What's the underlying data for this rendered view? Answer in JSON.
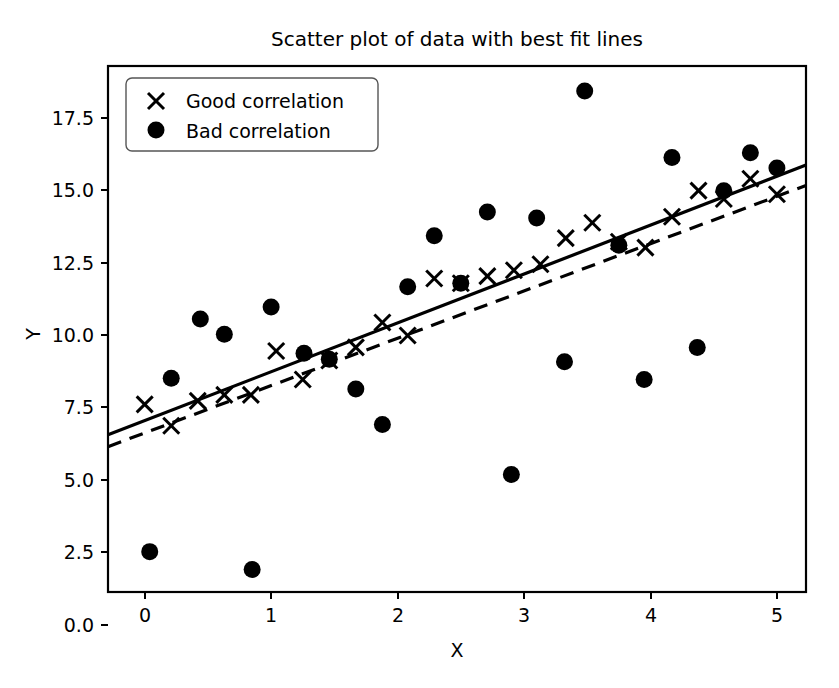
{
  "chart_data": {
    "type": "scatter",
    "title": "Scatter plot of data with best fit lines",
    "xlabel": "X",
    "ylabel": "Y",
    "xlim": [
      -0.29,
      5.23
    ],
    "ylim": [
      -2.2,
      19.95
    ],
    "grid": false,
    "legend_position": "upper left",
    "xticks": [
      "0",
      "1",
      "2",
      "3",
      "4",
      "5"
    ],
    "xtick_values": [
      0,
      1,
      2,
      3,
      4,
      5
    ],
    "yticks": [
      "0.0",
      "2.5",
      "5.0",
      "7.5",
      "10.0",
      "12.5",
      "15.0",
      "17.5"
    ],
    "ytick_values": [
      0.0,
      2.5,
      5.0,
      7.5,
      10.0,
      12.5,
      15.0,
      17.5
    ],
    "series": [
      {
        "name": "Good correlation",
        "marker": "x",
        "color": "#000000",
        "points": [
          [
            0.0,
            5.7
          ],
          [
            0.21,
            4.8
          ],
          [
            0.42,
            5.85
          ],
          [
            0.63,
            6.1
          ],
          [
            0.84,
            6.1
          ],
          [
            1.04,
            7.95
          ],
          [
            1.25,
            6.75
          ],
          [
            1.46,
            7.55
          ],
          [
            1.67,
            8.1
          ],
          [
            1.88,
            9.15
          ],
          [
            2.08,
            8.6
          ],
          [
            2.29,
            11.0
          ],
          [
            2.5,
            10.8
          ],
          [
            2.71,
            11.1
          ],
          [
            2.92,
            11.35
          ],
          [
            3.13,
            11.6
          ],
          [
            3.33,
            12.7
          ],
          [
            3.54,
            13.35
          ],
          [
            3.75,
            12.55
          ],
          [
            3.96,
            12.3
          ],
          [
            4.17,
            13.6
          ],
          [
            4.38,
            14.7
          ],
          [
            4.58,
            14.35
          ],
          [
            4.79,
            15.2
          ],
          [
            5.0,
            14.55
          ]
        ]
      },
      {
        "name": "Bad correlation",
        "marker": "o",
        "color": "#000000",
        "points": [
          [
            0.04,
            -0.5
          ],
          [
            0.21,
            6.8
          ],
          [
            0.44,
            9.3
          ],
          [
            0.63,
            8.65
          ],
          [
            0.85,
            -1.25
          ],
          [
            1.0,
            9.8
          ],
          [
            1.26,
            7.85
          ],
          [
            1.46,
            7.6
          ],
          [
            1.67,
            6.35
          ],
          [
            1.88,
            4.85
          ],
          [
            2.08,
            10.65
          ],
          [
            2.29,
            12.8
          ],
          [
            2.5,
            10.8
          ],
          [
            2.71,
            13.8
          ],
          [
            2.9,
            2.75
          ],
          [
            3.1,
            13.55
          ],
          [
            3.32,
            7.5
          ],
          [
            3.48,
            18.9
          ],
          [
            3.75,
            12.4
          ],
          [
            3.95,
            6.75
          ],
          [
            4.17,
            16.1
          ],
          [
            4.37,
            8.1
          ],
          [
            4.58,
            14.7
          ],
          [
            4.79,
            16.3
          ],
          [
            5.0,
            15.65
          ]
        ]
      }
    ],
    "fit_lines": [
      {
        "name": "Good correlation fit",
        "style": "solid",
        "x": [
          -0.29,
          5.23
        ],
        "y": [
          4.42,
          15.78
        ]
      },
      {
        "name": "Bad correlation fit",
        "style": "dashed",
        "x": [
          -0.29,
          5.23
        ],
        "y": [
          3.92,
          14.92
        ]
      }
    ]
  },
  "legend": {
    "entries": [
      {
        "label": "Good correlation",
        "marker": "x"
      },
      {
        "label": "Bad correlation",
        "marker": "o"
      }
    ]
  }
}
